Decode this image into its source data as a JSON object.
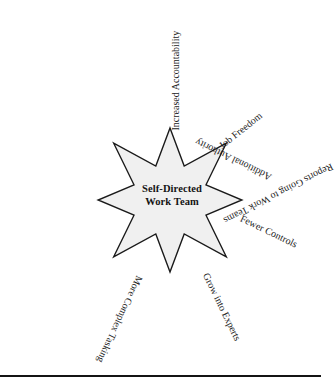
{
  "figure": {
    "type": "star-diagram",
    "center_label_line1": "Self-Directed",
    "center_label_line2": "Work Team",
    "star_points": 7,
    "star_fill_color": "#f0f0f0",
    "star_stroke_color": "#1a1a1a",
    "background_color": "#ffffff",
    "text_color": "#1c1c1c",
    "footer_rule_color": "#141414",
    "spokes": [
      {
        "id": "increased-accountability",
        "label": "Increased Accountability",
        "angle_deg": -90,
        "position": "top"
      },
      {
        "id": "job-freedom",
        "label": "Job Freedom",
        "angle_deg": -38.5,
        "position": "upper-right"
      },
      {
        "id": "fewer-controls",
        "label": "Fewer Controls",
        "angle_deg": 26,
        "position": "right"
      },
      {
        "id": "grow-into-experts",
        "label": "Grow into Experts",
        "angle_deg": 64,
        "position": "lower-right"
      },
      {
        "id": "more-complex-tasking",
        "label": "More Complex Tasking",
        "angle_deg": 115,
        "position": "lower-left"
      },
      {
        "id": "reports-going-to-work-teams",
        "label": "Reports Going to Work Teams",
        "angle_deg": 153,
        "position": "left"
      },
      {
        "id": "additional-authority",
        "label": "Additional Authority",
        "angle_deg": -154,
        "position": "upper-left"
      }
    ]
  }
}
